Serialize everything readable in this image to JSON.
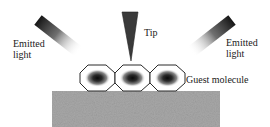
{
  "diagram": {
    "labels": {
      "emitted_left_line1": "Emitted",
      "emitted_left_line2": "light",
      "emitted_right_line1": "Emitted",
      "emitted_right_line2": "light",
      "tip": "Tip",
      "guest_molecule": "Guest molecule"
    },
    "elements": {
      "tip": "stm-tip",
      "beams": [
        "emitted-light-left",
        "emitted-light-right"
      ],
      "molecules": 3,
      "substrate": "substrate"
    },
    "colors": {
      "tip": "#3a3a3a",
      "beam_dark": "#1e1e1e",
      "molecule_outline": "#2a2a2a",
      "molecule_core": "#101010",
      "substrate": "#a8a8a8",
      "text": "#1a1a1a"
    }
  }
}
